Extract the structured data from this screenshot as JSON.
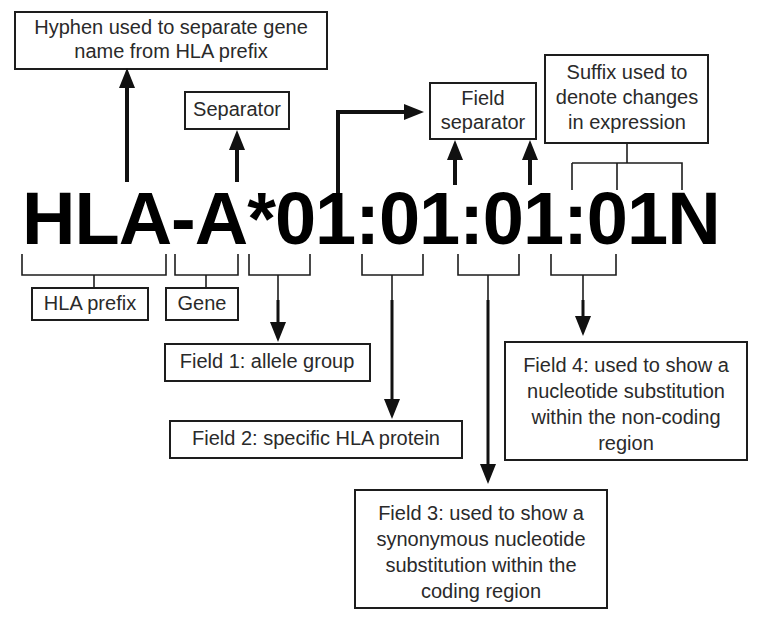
{
  "diagram": {
    "allele_string": "HLA-A*01:01:01:01N",
    "stroke_color": "#1d1d1d",
    "background_color": "#ffffff",
    "text_color": "#2a2a2a"
  },
  "boxes": {
    "hyphen_note": "Hyphen used to separate gene\nname from HLA prefix",
    "hyphen_note_line1": "Hyphen used to separate gene",
    "hyphen_note_line2": "name from HLA prefix",
    "separator": "Separator",
    "field_separator_line1": "Field",
    "field_separator_line2": "separator",
    "suffix_line1": "Suffix used to",
    "suffix_line2": "denote changes",
    "suffix_line3": "in expression",
    "hla_prefix": "HLA prefix",
    "gene": "Gene",
    "field1": "Field 1: allele group",
    "field2": "Field 2: specific HLA protein",
    "field3_line1": "Field 3: used to show a",
    "field3_line2": "synonymous nucleotide",
    "field3_line3": "substitution within the",
    "field3_line4": "coding region",
    "field4_line1": "Field 4: used to show a",
    "field4_line2": "nucleotide substitution",
    "field4_line3": "within the non-coding",
    "field4_line4": "region"
  },
  "allele_segments": [
    {
      "label": "HLA",
      "meaning": "HLA prefix"
    },
    {
      "label": "-",
      "meaning": "Hyphen used to separate gene name from HLA prefix"
    },
    {
      "label": "A",
      "meaning": "Gene"
    },
    {
      "label": "*",
      "meaning": "Separator"
    },
    {
      "label": "01",
      "meaning": "Field 1: allele group"
    },
    {
      "label": ":",
      "meaning": "Field separator"
    },
    {
      "label": "01",
      "meaning": "Field 2: specific HLA protein"
    },
    {
      "label": ":",
      "meaning": "Field separator"
    },
    {
      "label": "01",
      "meaning": "Field 3: used to show a synonymous nucleotide substitution within the coding region"
    },
    {
      "label": ":",
      "meaning": "Field separator"
    },
    {
      "label": "01",
      "meaning": "Field 4: used to show a nucleotide substitution within the non-coding region"
    },
    {
      "label": "N",
      "meaning": "Suffix used to denote changes in expression"
    }
  ]
}
